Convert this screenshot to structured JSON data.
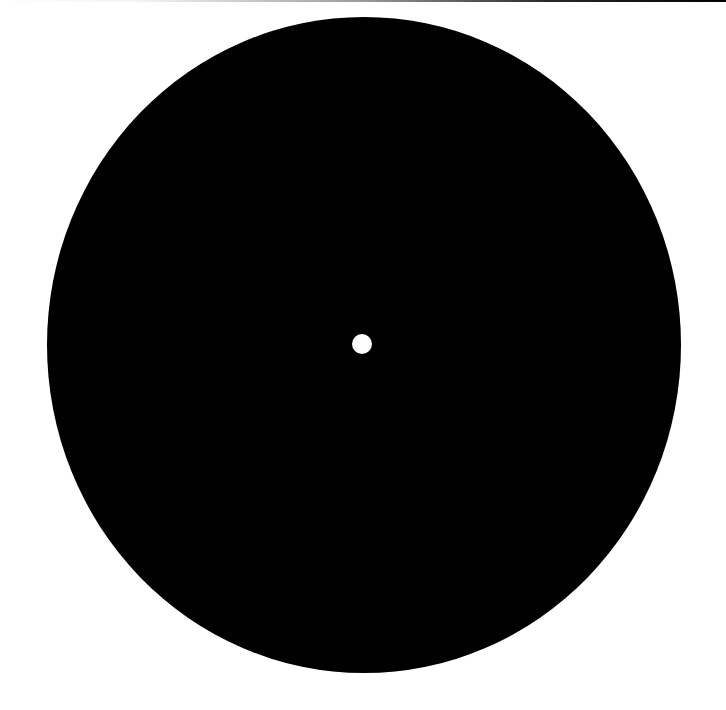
{
  "canvas": {
    "width": 726,
    "height": 710,
    "background_color": "#ffffff"
  },
  "top_line": {
    "gradient_start_color": "#ffffff",
    "gradient_end_color": "#000000"
  },
  "disc": {
    "shape": "ellipse",
    "fill_color": "#000000",
    "center_x": 364,
    "center_y": 345,
    "radius_x": 317,
    "radius_y": 328
  },
  "center_hole": {
    "shape": "circle",
    "fill_color": "#ffffff",
    "center_x": 362,
    "center_y": 344,
    "radius": 10
  }
}
